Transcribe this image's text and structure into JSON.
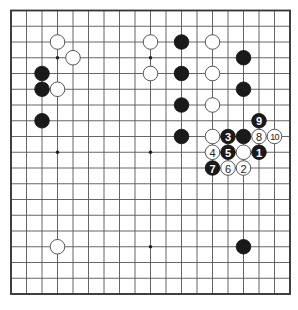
{
  "board": {
    "size": 19,
    "star_points": [
      [
        3,
        3
      ],
      [
        9,
        3
      ],
      [
        15,
        3
      ],
      [
        3,
        9
      ],
      [
        9,
        9
      ],
      [
        15,
        9
      ],
      [
        3,
        15
      ],
      [
        9,
        15
      ],
      [
        15,
        15
      ]
    ],
    "colors": {
      "black": "#1a1a1a",
      "white": "#ffffff",
      "line": "#555555"
    }
  },
  "stones": [
    {
      "col": 3,
      "row": 2,
      "color": "white",
      "label": ""
    },
    {
      "col": 4,
      "row": 3,
      "color": "white",
      "label": ""
    },
    {
      "col": 2,
      "row": 4,
      "color": "black",
      "label": ""
    },
    {
      "col": 2,
      "row": 5,
      "color": "black",
      "label": ""
    },
    {
      "col": 3,
      "row": 5,
      "color": "white",
      "label": ""
    },
    {
      "col": 2,
      "row": 7,
      "color": "black",
      "label": ""
    },
    {
      "col": 9,
      "row": 2,
      "color": "white",
      "label": ""
    },
    {
      "col": 9,
      "row": 4,
      "color": "white",
      "label": ""
    },
    {
      "col": 11,
      "row": 2,
      "color": "black",
      "label": ""
    },
    {
      "col": 11,
      "row": 4,
      "color": "black",
      "label": ""
    },
    {
      "col": 11,
      "row": 6,
      "color": "black",
      "label": ""
    },
    {
      "col": 11,
      "row": 8,
      "color": "black",
      "label": ""
    },
    {
      "col": 13,
      "row": 2,
      "color": "white",
      "label": ""
    },
    {
      "col": 13,
      "row": 4,
      "color": "white",
      "label": ""
    },
    {
      "col": 13,
      "row": 6,
      "color": "white",
      "label": ""
    },
    {
      "col": 13,
      "row": 8,
      "color": "white",
      "label": ""
    },
    {
      "col": 15,
      "row": 3,
      "color": "black",
      "label": ""
    },
    {
      "col": 15,
      "row": 5,
      "color": "black",
      "label": ""
    },
    {
      "col": 15,
      "row": 8,
      "color": "black",
      "label": ""
    },
    {
      "col": 15,
      "row": 9,
      "color": "white",
      "label": ""
    },
    {
      "col": 16,
      "row": 9,
      "color": "black",
      "label": "1"
    },
    {
      "col": 15,
      "row": 10,
      "color": "white",
      "label": "2"
    },
    {
      "col": 14,
      "row": 8,
      "color": "black",
      "label": "3"
    },
    {
      "col": 13,
      "row": 9,
      "color": "white",
      "label": "4"
    },
    {
      "col": 14,
      "row": 9,
      "color": "black",
      "label": "5"
    },
    {
      "col": 14,
      "row": 10,
      "color": "white",
      "label": "6"
    },
    {
      "col": 13,
      "row": 10,
      "color": "black",
      "label": "7"
    },
    {
      "col": 16,
      "row": 8,
      "color": "white",
      "label": "8"
    },
    {
      "col": 16,
      "row": 7,
      "color": "black",
      "label": "9"
    },
    {
      "col": 17,
      "row": 8,
      "color": "white",
      "label": "10"
    },
    {
      "col": 3,
      "row": 15,
      "color": "white",
      "label": ""
    },
    {
      "col": 15,
      "row": 15,
      "color": "black",
      "label": ""
    }
  ]
}
